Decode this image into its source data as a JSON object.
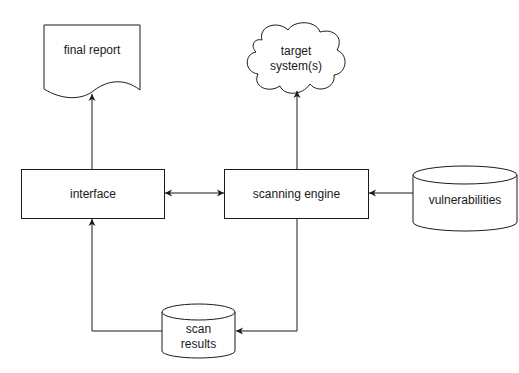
{
  "diagram": {
    "nodes": {
      "final_report": {
        "label": "final report",
        "shape": "document"
      },
      "target_systems": {
        "label_line1": "target",
        "label_line2": "system(s)",
        "shape": "cloud"
      },
      "interface": {
        "label": "interface",
        "shape": "rectangle"
      },
      "scanning_engine": {
        "label": "scanning engine",
        "shape": "rectangle"
      },
      "vulnerabilities": {
        "label": "vulnerabilities",
        "shape": "database"
      },
      "scan_results": {
        "label_line1": "scan",
        "label_line2": "results",
        "shape": "database"
      }
    },
    "edges": [
      {
        "from": "interface",
        "to": "final_report"
      },
      {
        "from": "scanning_engine",
        "to": "target_systems"
      },
      {
        "from": "interface",
        "to": "scanning_engine",
        "bidirectional": true
      },
      {
        "from": "vulnerabilities",
        "to": "scanning_engine"
      },
      {
        "from": "scanning_engine",
        "to": "scan_results"
      },
      {
        "from": "scan_results",
        "to": "interface"
      }
    ],
    "colors": {
      "stroke": "#1a1a1a",
      "fill": "#ffffff",
      "text": "#1a1a1a"
    }
  }
}
